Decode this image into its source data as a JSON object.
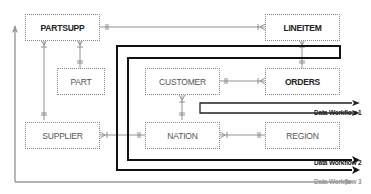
{
  "diagram": {
    "type": "entity-relationship with data workflows",
    "entities": [
      {
        "id": "partsupp",
        "label": "PARTSUPP",
        "bold": true
      },
      {
        "id": "lineitem",
        "label": "LINEITEM",
        "bold": true
      },
      {
        "id": "part",
        "label": "PART",
        "bold": false
      },
      {
        "id": "customer",
        "label": "CUSTOMER",
        "bold": false
      },
      {
        "id": "orders",
        "label": "ORDERS",
        "bold": true
      },
      {
        "id": "supplier",
        "label": "SUPPLIER",
        "bold": false
      },
      {
        "id": "nation",
        "label": "NATION",
        "bold": false
      },
      {
        "id": "region",
        "label": "REGION",
        "bold": false
      }
    ],
    "relationships": [
      {
        "from": "partsupp",
        "to": "lineitem"
      },
      {
        "from": "partsupp",
        "to": "part"
      },
      {
        "from": "partsupp",
        "to": "supplier"
      },
      {
        "from": "lineitem",
        "to": "orders"
      },
      {
        "from": "customer",
        "to": "orders"
      },
      {
        "from": "customer",
        "to": "nation"
      },
      {
        "from": "supplier",
        "to": "nation"
      },
      {
        "from": "nation",
        "to": "region"
      }
    ],
    "workflows": [
      {
        "id": "wf1",
        "label": "Data Workflow 1",
        "color": "#222222"
      },
      {
        "id": "wf2",
        "label": "Data Workflow 2",
        "color": "#111111"
      },
      {
        "id": "wf3",
        "label": "Data Workflow 3",
        "color": "#9a9a9a"
      }
    ]
  }
}
